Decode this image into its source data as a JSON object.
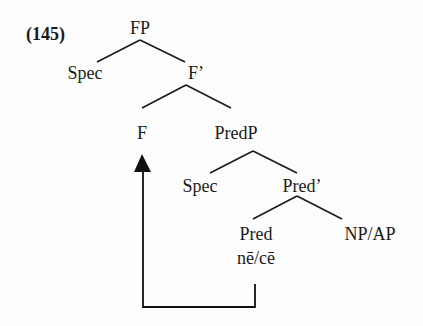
{
  "example_number": "(145)",
  "tree": {
    "root": "FP",
    "spec1": "Spec",
    "fbar": "F’",
    "f_head": "F",
    "predp": "PredP",
    "spec2": "Spec",
    "predbar": "Pred’",
    "pred_head": "Pred",
    "complement": "NP/AP",
    "pred_lexical": "nē/cē"
  },
  "movement": {
    "from": "Pred",
    "to": "F",
    "description": "head movement arrow"
  }
}
